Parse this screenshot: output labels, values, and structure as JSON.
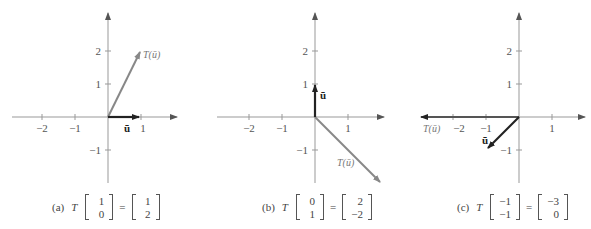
{
  "panels": [
    {
      "id": "a",
      "tag": "(a)",
      "origin": [
        108,
        117
      ],
      "x_ticks": [
        "−2",
        "−1",
        "1"
      ],
      "y_ticks": [
        "2",
        "1",
        "−1"
      ],
      "u": [
        1,
        0
      ],
      "Tu": [
        2,
        1
      ],
      "u_label": "ū",
      "Tu_label": "T(ū)",
      "caption": {
        "T": "T",
        "input": [
          "1",
          "0"
        ],
        "eq": "=",
        "output": [
          "1",
          "2"
        ]
      }
    },
    {
      "id": "b",
      "tag": "(b)",
      "origin": [
        315,
        117
      ],
      "x_ticks": [
        "−2",
        "−1",
        "1"
      ],
      "y_ticks": [
        "2",
        "1",
        "−1"
      ],
      "u": [
        0,
        1
      ],
      "Tu": [
        2,
        -2
      ],
      "u_label": "ū",
      "Tu_label": "T(ū)",
      "caption": {
        "T": "T",
        "input": [
          "0",
          "1"
        ],
        "eq": "=",
        "output": [
          "2",
          "−2"
        ]
      }
    },
    {
      "id": "c",
      "tag": "(c)",
      "origin": [
        519,
        117
      ],
      "x_ticks": [
        "−2",
        "−1",
        "1"
      ],
      "y_ticks": [
        "2",
        "1",
        "−1"
      ],
      "u": [
        -1,
        -1
      ],
      "Tu": [
        -3,
        0
      ],
      "u_label": "ū",
      "Tu_label": "T(ū)",
      "caption": {
        "T": "T",
        "input": [
          "−1",
          "−1"
        ],
        "eq": "=",
        "output": [
          "−3",
          "0"
        ]
      }
    }
  ],
  "colors": {
    "axis": "#888888",
    "u_vector": "#222222",
    "Tu_vector": "#888888"
  }
}
